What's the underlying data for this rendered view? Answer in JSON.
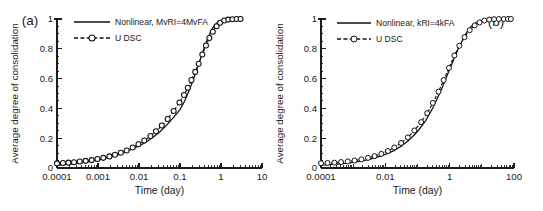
{
  "figure": {
    "panels": [
      {
        "tag": "(a)",
        "tag_position": "top-left",
        "legend": [
          {
            "label": "Nonlinear, MvRI=4MvFA",
            "style": "solid-line",
            "marker": "none"
          },
          {
            "label": "U DSC",
            "style": "dashed-line",
            "marker": "circle-filled"
          }
        ],
        "chart_data": {
          "type": "line",
          "title": "",
          "xlabel": "Time (day)",
          "ylabel": "Average degree of consolidation",
          "xscale": "log",
          "xlim": [
            0.0001,
            10
          ],
          "ylim": [
            0,
            1
          ],
          "xticks": [
            "0.0001",
            "0.001",
            "0.01",
            "0.1",
            "1",
            "10"
          ],
          "xtick_values": [
            0.0001,
            0.001,
            0.01,
            0.1,
            1,
            10
          ],
          "yticks": [
            "0",
            "0.2",
            "0.4",
            "0.6",
            "0.8",
            "1"
          ],
          "ytick_values": [
            0,
            0.2,
            0.4,
            0.6,
            0.8,
            1
          ],
          "grid": false,
          "legend_position": "upper-left",
          "series": [
            {
              "name": "Nonlinear, MvRI=4MvFA",
              "style": "solid",
              "markers": false,
              "x": [
                0.0001,
                0.00015,
                0.00022,
                0.00032,
                0.00046,
                0.00068,
                0.001,
                0.0015,
                0.0022,
                0.0032,
                0.0046,
                0.0068,
                0.01,
                0.015,
                0.022,
                0.032,
                0.046,
                0.068,
                0.1,
                0.13,
                0.16,
                0.2,
                0.25,
                0.3,
                0.36,
                0.42,
                0.5,
                0.6,
                0.7,
                0.85,
                1.0,
                1.3,
                1.7,
                2.2,
                3.0
              ],
              "y": [
                0.018,
                0.022,
                0.026,
                0.031,
                0.037,
                0.045,
                0.053,
                0.064,
                0.076,
                0.09,
                0.107,
                0.128,
                0.148,
                0.175,
                0.206,
                0.242,
                0.284,
                0.336,
                0.392,
                0.45,
                0.508,
                0.575,
                0.651,
                0.714,
                0.78,
                0.833,
                0.884,
                0.93,
                0.958,
                0.98,
                0.99,
                0.996,
                0.999,
                1.0,
                1.0
              ]
            },
            {
              "name": "U DSC",
              "style": "dashed",
              "markers": true,
              "x": [
                0.0001,
                0.00014,
                0.00019,
                0.00026,
                0.00036,
                0.0005,
                0.0007,
                0.00097,
                0.00135,
                0.0019,
                0.0026,
                0.0036,
                0.005,
                0.007,
                0.0097,
                0.0135,
                0.019,
                0.026,
                0.036,
                0.05,
                0.07,
                0.097,
                0.125,
                0.155,
                0.19,
                0.235,
                0.285,
                0.35,
                0.43,
                0.52,
                0.63,
                0.78,
                0.95,
                1.2,
                1.5,
                1.9,
                2.4,
                3.0
              ],
              "y": [
                0.031,
                0.033,
                0.036,
                0.039,
                0.043,
                0.048,
                0.053,
                0.06,
                0.068,
                0.078,
                0.089,
                0.102,
                0.118,
                0.137,
                0.159,
                0.185,
                0.215,
                0.247,
                0.285,
                0.329,
                0.383,
                0.44,
                0.49,
                0.538,
                0.59,
                0.645,
                0.7,
                0.762,
                0.822,
                0.872,
                0.915,
                0.952,
                0.975,
                0.99,
                0.996,
                0.999,
                1.0,
                1.0
              ]
            }
          ]
        }
      },
      {
        "tag": "(b)",
        "tag_position": "top-right",
        "legend": [
          {
            "label": "Nonlinear, kRI=4kFA",
            "style": "solid-line",
            "marker": "none"
          },
          {
            "label": "U DSC",
            "style": "dashed-line",
            "marker": "circle-open"
          }
        ],
        "chart_data": {
          "type": "line",
          "title": "",
          "xlabel": "Time (day)",
          "ylabel": "Average degree of consolidation",
          "xscale": "log",
          "xlim": [
            0.0001,
            100
          ],
          "ylim": [
            0,
            1
          ],
          "xticks": [
            "0.0001",
            "0.01",
            "1",
            "100"
          ],
          "xtick_values": [
            0.0001,
            0.01,
            1,
            100
          ],
          "yticks": [
            "0",
            "0.2",
            "0.4",
            "0.6",
            "0.8",
            "1"
          ],
          "ytick_values": [
            0,
            0.2,
            0.4,
            0.6,
            0.8,
            1
          ],
          "grid": false,
          "legend_position": "upper-left",
          "series": [
            {
              "name": "Nonlinear, kRI=4kFA",
              "style": "solid",
              "markers": false,
              "x": [
                0.0001,
                0.00018,
                0.00032,
                0.00056,
                0.001,
                0.0018,
                0.0032,
                0.0056,
                0.01,
                0.018,
                0.032,
                0.056,
                0.1,
                0.18,
                0.32,
                0.56,
                1.0,
                1.8,
                3.2,
                4.6,
                6.8,
                10,
                14,
                20,
                30,
                45,
                60,
                80
              ],
              "y": [
                0.02,
                0.022,
                0.026,
                0.031,
                0.038,
                0.047,
                0.058,
                0.073,
                0.091,
                0.115,
                0.147,
                0.19,
                0.245,
                0.318,
                0.414,
                0.53,
                0.662,
                0.795,
                0.902,
                0.948,
                0.976,
                0.99,
                0.996,
                0.999,
                1.0,
                1.0,
                1.0,
                1.0
              ]
            },
            {
              "name": "U DSC",
              "style": "dashed",
              "markers": true,
              "x": [
                0.0001,
                0.00016,
                0.00026,
                0.00042,
                0.00068,
                0.0011,
                0.0018,
                0.0029,
                0.0046,
                0.0075,
                0.012,
                0.019,
                0.031,
                0.05,
                0.08,
                0.13,
                0.2,
                0.3,
                0.45,
                0.65,
                0.95,
                1.4,
                2.0,
                2.9,
                4.2,
                6.0,
                8.5,
                12,
                17,
                24,
                34,
                48,
                65,
                80
              ],
              "y": [
                0.032,
                0.034,
                0.036,
                0.04,
                0.044,
                0.05,
                0.058,
                0.068,
                0.08,
                0.095,
                0.114,
                0.138,
                0.168,
                0.205,
                0.252,
                0.308,
                0.368,
                0.437,
                0.512,
                0.59,
                0.672,
                0.755,
                0.82,
                0.878,
                0.925,
                0.957,
                0.977,
                0.99,
                0.996,
                0.999,
                1.0,
                1.0,
                1.0,
                1.0
              ]
            }
          ]
        }
      }
    ]
  }
}
